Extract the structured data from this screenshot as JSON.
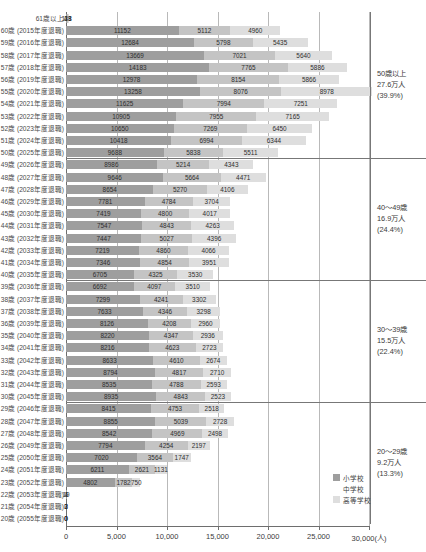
{
  "chart_data": {
    "type": "bar",
    "orientation": "horizontal",
    "stacked": true,
    "title": "",
    "xlabel": "30,000(人)",
    "ylabel": "",
    "xlim": [
      0,
      30000
    ],
    "grid": true,
    "legend_position": "bottom-right",
    "xticks": [
      "0",
      "5,000",
      "10,000",
      "15,000",
      "20,000",
      "25,000",
      "30,000(人)"
    ],
    "xtick_values": [
      0,
      5000,
      10000,
      15000,
      20000,
      25000,
      30000
    ],
    "series": [
      {
        "name": "小学校",
        "color": "#9e9e9e"
      },
      {
        "name": "中学校",
        "color": "#c4c4c4"
      },
      {
        "name": "高等学校",
        "color": "#dedede"
      }
    ],
    "categories": [
      "61歳以上",
      "60歳 (2015年度退職)",
      "59歳 (2016年度退職)",
      "58歳 (2017年度退職)",
      "57歳 (2018年度退職)",
      "56歳 (2019年度退職)",
      "55歳 (2020年度退職)",
      "54歳 (2021年度退職)",
      "53歳 (2022年度退職)",
      "52歳 (2023年度退職)",
      "51歳 (2024年度退職)",
      "50歳 (2025年度退職)",
      "49歳 (2026年度退職)",
      "48歳 (2027年度退職)",
      "47歳 (2028年度退職)",
      "46歳 (2029年度退職)",
      "45歳 (2030年度退職)",
      "44歳 (2031年度退職)",
      "43歳 (2032年度退職)",
      "42歳 (2033年度退職)",
      "41歳 (2034年度退職)",
      "40歳 (2035年度退職)",
      "39歳 (2036年度退職)",
      "38歳 (2037年度退職)",
      "37歳 (2038年度退職)",
      "36歳 (2039年度退職)",
      "35歳 (2040年度退職)",
      "34歳 (2041年度退職)",
      "33歳 (2042年度退職)",
      "32歳 (2043年度退職)",
      "31歳 (2044年度退職)",
      "30歳 (2045年度退職)",
      "29歳 (2046年度退職)",
      "28歳 (2047年度退職)",
      "27歳 (2048年度退職)",
      "26歳 (2049年度退職)",
      "25歳 (2050年度退職)",
      "24歳 (2051年度退職)",
      "23歳 (2052年度退職)",
      "22歳 (2053年度退職)",
      "21歳 (2054年度退職)",
      "20歳 (2055年度退職)"
    ],
    "values": [
      [
        118,
        43,
        38
      ],
      [
        11152,
        5112,
        4960
      ],
      [
        12684,
        5798,
        5435
      ],
      [
        13669,
        7021,
        5640
      ],
      [
        14183,
        7765,
        5886
      ],
      [
        12978,
        8154,
        5866
      ],
      [
        13258,
        8076,
        8978
      ],
      [
        11625,
        7994,
        7251
      ],
      [
        10905,
        7955,
        7165
      ],
      [
        10650,
        7269,
        6450
      ],
      [
        10418,
        6994,
        6344
      ],
      [
        9688,
        5838,
        5511
      ],
      [
        8986,
        5214,
        4343
      ],
      [
        9646,
        5664,
        4471
      ],
      [
        8654,
        5270,
        4106
      ],
      [
        7781,
        4784,
        3704
      ],
      [
        7419,
        4800,
        4017
      ],
      [
        7547,
        4843,
        4263
      ],
      [
        7447,
        5027,
        4396
      ],
      [
        7219,
        4860,
        4066
      ],
      [
        7346,
        4854,
        3951
      ],
      [
        6705,
        4325,
        3530
      ],
      [
        6692,
        4097,
        3510
      ],
      [
        7299,
        4241,
        3302
      ],
      [
        7633,
        4346,
        3298
      ],
      [
        8126,
        4208,
        2960
      ],
      [
        8220,
        4347,
        2936
      ],
      [
        8216,
        4623,
        2723
      ],
      [
        8633,
        4610,
        2674
      ],
      [
        8794,
        4817,
        2710
      ],
      [
        8535,
        4788,
        2593
      ],
      [
        8935,
        4843,
        2523
      ],
      [
        8415,
        4753,
        2518
      ],
      [
        8855,
        5039,
        2728
      ],
      [
        8542,
        4969,
        2498
      ],
      [
        7794,
        4254,
        2197
      ],
      [
        7020,
        3564,
        1747
      ],
      [
        6211,
        2621,
        1131
      ],
      [
        4802,
        1782,
        750
      ],
      [
        19,
        1,
        4
      ],
      [
        3,
        2,
        0
      ],
      [
        0,
        0,
        0
      ]
    ]
  },
  "annotations": {
    "group1": {
      "range": "50歳以上",
      "count": "27.6万人",
      "percent": "(39.9%)"
    },
    "group2": {
      "range": "40～49歳",
      "count": "16.9万人",
      "percent": "(24.4%)"
    },
    "group3": {
      "range": "30～39歳",
      "count": "15.5万人",
      "percent": "(22.4%)"
    },
    "group4": {
      "range": "20～29歳",
      "count": "9.2万人",
      "percent": "(13.3%)"
    }
  }
}
